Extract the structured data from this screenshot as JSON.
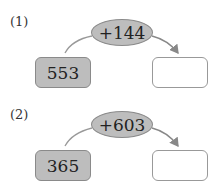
{
  "problems": [
    {
      "label": "(1)",
      "operation": "+144",
      "start": "553",
      "answer": ""
    },
    {
      "label": "(2)",
      "operation": "+603",
      "start": "365",
      "answer": ""
    }
  ],
  "colors": {
    "shape_fill": "#bdbdbd",
    "shape_border": "#8a8a8a",
    "arrow": "#888888"
  }
}
